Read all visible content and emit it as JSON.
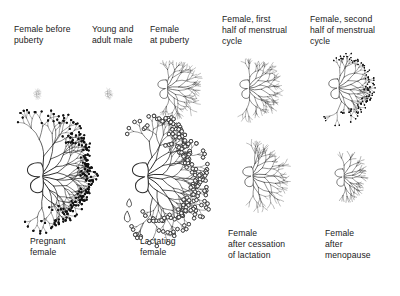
{
  "figure": {
    "background_color": "#ffffff",
    "line_color": "#2b2b2b",
    "text_color": "#1a1a1a",
    "width": 400,
    "height": 296
  },
  "rows": [
    {
      "name": "top-row",
      "caption_position": "above",
      "panels": [
        {
          "id": "female-before-puberty",
          "caption": "Female before\npuberty",
          "caption_x": 14,
          "caption_y": 24,
          "figure_x": 38,
          "figure_y": 95,
          "scale": 0.16,
          "tip_style": "none",
          "droplet": false,
          "description": "very small rudimentary duct system"
        },
        {
          "id": "young-and-adult-male",
          "caption": "Young and\nadult male",
          "caption_x": 92,
          "caption_y": 24,
          "figure_x": 110,
          "figure_y": 95,
          "scale": 0.17,
          "tip_style": "none",
          "droplet": false,
          "description": "small rudimentary duct system"
        },
        {
          "id": "female-at-puberty",
          "caption": "Female\nat puberty",
          "caption_x": 150,
          "caption_y": 24,
          "figure_x": 176,
          "figure_y": 92,
          "scale": 0.62,
          "tip_style": "none",
          "droplet": false,
          "description": "branched ductal tree, no lobules"
        },
        {
          "id": "female-first-half-menstrual-cycle",
          "caption": "Female, first\nhalf of menstrual\ncycle",
          "caption_x": 222,
          "caption_y": 14,
          "figure_x": 258,
          "figure_y": 92,
          "scale": 0.62,
          "tip_style": "none",
          "droplet": false,
          "description": "branched ductal tree"
        },
        {
          "id": "female-second-half-menstrual-cycle",
          "caption": "Female, second\nhalf of menstrual\ncycle",
          "caption_x": 310,
          "caption_y": 14,
          "figure_x": 348,
          "figure_y": 92,
          "scale": 0.66,
          "tip_style": "filled",
          "droplet": false,
          "description": "ductal tree with small dark lobular buds at tips"
        }
      ]
    },
    {
      "name": "bottom-row",
      "caption_position": "below",
      "panels": [
        {
          "id": "pregnant-female",
          "caption": "Pregnant\nfemale",
          "caption_x": 30,
          "caption_y": 236,
          "figure_x": 56,
          "figure_y": 182,
          "scale": 1.0,
          "tip_style": "filled",
          "droplet": false,
          "description": "large dense tree with many alveolar buds"
        },
        {
          "id": "lactating-female",
          "caption": "Lactating\nfemale",
          "caption_x": 140,
          "caption_y": 236,
          "figure_x": 161,
          "figure_y": 182,
          "scale": 1.0,
          "tip_style": "open",
          "droplet": true,
          "description": "large tree with open alveoli and a milk droplet at the nipple"
        },
        {
          "id": "female-after-cessation-of-lactation",
          "caption": "Female\nafter cessation\nof lactation",
          "caption_x": 228,
          "caption_y": 228,
          "figure_x": 262,
          "figure_y": 180,
          "scale": 0.66,
          "tip_style": "none",
          "droplet": false,
          "description": "regressed ductal tree"
        },
        {
          "id": "female-after-menopause",
          "caption": "Female\nafter\nmenopause",
          "caption_x": 325,
          "caption_y": 228,
          "figure_x": 352,
          "figure_y": 180,
          "scale": 0.58,
          "tip_style": "none",
          "droplet": false,
          "description": "sparse atrophied ductal tree"
        }
      ]
    }
  ]
}
